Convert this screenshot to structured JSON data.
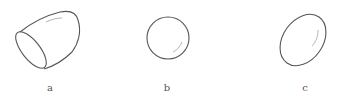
{
  "figure": {
    "panels": [
      {
        "id": "a",
        "label": "a",
        "shape": "tilted cylinder / capsule with flat elliptical end"
      },
      {
        "id": "b",
        "label": "b",
        "shape": "circle"
      },
      {
        "id": "c",
        "label": "c",
        "shape": "tilted ellipse"
      }
    ]
  },
  "colors": {
    "stroke": "#555555",
    "highlight": "#b5b5b5",
    "background": "#ffffff"
  }
}
